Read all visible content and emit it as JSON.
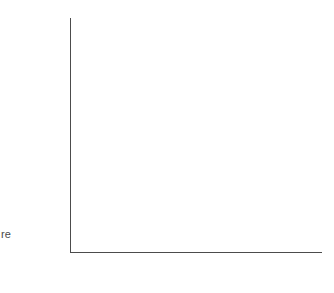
{
  "figure": {
    "edge_fragment": "re"
  },
  "axes": {
    "x": {
      "title_parts": {
        "pre": "Critical concentration, acute (=LC",
        "sub": "50",
        "mid": ") (µg l",
        "sup": "−1",
        "post": ")"
      },
      "tick_labels": [
        "1",
        "10",
        "100",
        "10³",
        "10⁴",
        "10⁵"
      ],
      "tick_values": [
        1,
        10,
        100,
        1000,
        10000,
        100000
      ],
      "range": [
        0.35,
        240000
      ],
      "scale": "log"
    },
    "y": {
      "title_parts": {
        "pre": "Critical concentration, chronic (µg l",
        "sup": "−1",
        "post": ")"
      },
      "tick_labels": [
        "0.1",
        "1",
        "10",
        "100",
        "10³",
        "10⁴"
      ],
      "tick_values": [
        0.1,
        1,
        10,
        100,
        1000,
        10000
      ],
      "range": [
        0.1,
        25000
      ],
      "scale": "log"
    }
  },
  "chart_data": {
    "type": "scatter",
    "title": "",
    "xlabel": "Critical concentration, acute (=LC50) (µg l-1)",
    "ylabel": "Critical concentration, chronic (µg l-1)",
    "xscale": "log",
    "yscale": "log",
    "xlim": [
      0.35,
      240000
    ],
    "ylim": [
      0.1,
      25000
    ],
    "xticks": [
      1,
      10,
      100,
      1000,
      10000,
      100000
    ],
    "yticks": [
      0.1,
      1,
      10,
      100,
      1000,
      10000
    ],
    "grid": false,
    "legend": null,
    "marker": "filled-circle",
    "marker_color": "#0d0d0d",
    "line_color": "#555555",
    "fit_line": {
      "label": "1:1 regression line",
      "x_start": 1.25,
      "y_start": 0.1,
      "x_end": 160000,
      "y_end": 17000
    },
    "highlighted_point": {
      "x": 420,
      "y": 2.3,
      "annotation": "circled"
    },
    "points": [
      {
        "x": 0.55,
        "y": 0.22
      },
      {
        "x": 2.3,
        "y": 0.22
      },
      {
        "x": 6.5,
        "y": 0.13
      },
      {
        "x": 8.5,
        "y": 5.0
      },
      {
        "x": 9.5,
        "y": 0.41
      },
      {
        "x": 24,
        "y": 0.15
      },
      {
        "x": 55,
        "y": 24
      },
      {
        "x": 72,
        "y": 25
      },
      {
        "x": 58,
        "y": 0.78
      },
      {
        "x": 66,
        "y": 0.8
      },
      {
        "x": 80,
        "y": 0.55
      },
      {
        "x": 100,
        "y": 9.5
      },
      {
        "x": 100,
        "y": 8.0
      },
      {
        "x": 105,
        "y": 7.0
      },
      {
        "x": 130,
        "y": 13
      },
      {
        "x": 150,
        "y": 3.8
      },
      {
        "x": 165,
        "y": 3.7
      },
      {
        "x": 180,
        "y": 13
      },
      {
        "x": 195,
        "y": 3.4
      },
      {
        "x": 200,
        "y": 14
      },
      {
        "x": 230,
        "y": 16
      },
      {
        "x": 290,
        "y": 16
      },
      {
        "x": 310,
        "y": 120
      },
      {
        "x": 330,
        "y": 110
      },
      {
        "x": 420,
        "y": 2.3
      },
      {
        "x": 620,
        "y": 140
      },
      {
        "x": 700,
        "y": 25
      },
      {
        "x": 800,
        "y": 5.0
      },
      {
        "x": 1000,
        "y": 310
      },
      {
        "x": 1100,
        "y": 560
      },
      {
        "x": 1200,
        "y": 60
      },
      {
        "x": 1400,
        "y": 145
      },
      {
        "x": 1500,
        "y": 40
      },
      {
        "x": 2300,
        "y": 175
      },
      {
        "x": 2600,
        "y": 5.0
      },
      {
        "x": 2800,
        "y": 135
      },
      {
        "x": 2900,
        "y": 300
      },
      {
        "x": 3000,
        "y": 700
      },
      {
        "x": 3300,
        "y": 760
      },
      {
        "x": 3800,
        "y": 640
      },
      {
        "x": 4200,
        "y": 790
      },
      {
        "x": 4500,
        "y": 800
      },
      {
        "x": 4600,
        "y": 860
      },
      {
        "x": 4800,
        "y": 900
      },
      {
        "x": 4900,
        "y": 820
      },
      {
        "x": 5000,
        "y": 770
      },
      {
        "x": 5200,
        "y": 950
      },
      {
        "x": 5300,
        "y": 215
      },
      {
        "x": 5600,
        "y": 1400
      },
      {
        "x": 6000,
        "y": 180
      },
      {
        "x": 6400,
        "y": 1050
      },
      {
        "x": 6800,
        "y": 700
      },
      {
        "x": 7000,
        "y": 1150
      },
      {
        "x": 7400,
        "y": 240
      },
      {
        "x": 7600,
        "y": 400
      },
      {
        "x": 8000,
        "y": 1900
      },
      {
        "x": 8500,
        "y": 860
      },
      {
        "x": 9500,
        "y": 200
      },
      {
        "x": 12000,
        "y": 780
      },
      {
        "x": 14000,
        "y": 860
      },
      {
        "x": 15000,
        "y": 2200
      },
      {
        "x": 19000,
        "y": 2300
      },
      {
        "x": 21000,
        "y": 2250
      },
      {
        "x": 22000,
        "y": 260
      },
      {
        "x": 24000,
        "y": 2100
      },
      {
        "x": 30000,
        "y": 320
      },
      {
        "x": 52000,
        "y": 520
      },
      {
        "x": 95000,
        "y": 9500
      },
      {
        "x": 125000,
        "y": 6000
      },
      {
        "x": 135000,
        "y": 8000
      },
      {
        "x": 150000,
        "y": 19000
      }
    ]
  }
}
